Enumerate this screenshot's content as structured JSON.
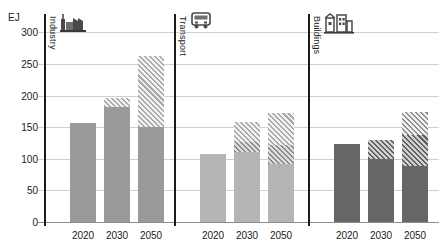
{
  "chart_data": {
    "type": "bar",
    "title": "",
    "ylabel": "EJ",
    "xlabel": "",
    "ylim": [
      0,
      310
    ],
    "yticks": [
      0,
      50,
      100,
      150,
      200,
      250,
      300
    ],
    "grid": true,
    "legend_position": "none",
    "categories": [
      "2020",
      "2030",
      "2050"
    ],
    "panels": [
      {
        "name": "Industry",
        "icon": "factory-icon",
        "base_color": "#9a9a9a",
        "series": [
          {
            "name": "solid",
            "style": "solid",
            "values": [
              156,
              182,
              150
            ]
          },
          {
            "name": "hatch",
            "style": "hatch-light",
            "values": [
              0,
              14,
              112
            ]
          }
        ],
        "totals": [
          156,
          196,
          262
        ]
      },
      {
        "name": "Transport",
        "icon": "bus-icon",
        "base_color": "#b5b5b5",
        "series": [
          {
            "name": "solid",
            "style": "solid",
            "values": [
              108,
              110,
              92
            ]
          },
          {
            "name": "hatch-dark",
            "style": "hatch-dark",
            "values": [
              0,
              16,
              30
            ]
          },
          {
            "name": "hatch-light",
            "style": "hatch-light",
            "values": [
              0,
              32,
              50
            ]
          }
        ],
        "totals": [
          108,
          158,
          172
        ]
      },
      {
        "name": "Buildings",
        "icon": "buildings-icon",
        "base_color": "#666666",
        "series": [
          {
            "name": "solid",
            "style": "solid",
            "values": [
              124,
              100,
              88
            ]
          },
          {
            "name": "hatch-dark",
            "style": "hatch-dark",
            "values": [
              0,
              30,
              50
            ]
          },
          {
            "name": "hatch-light",
            "style": "hatch-light",
            "values": [
              0,
              0,
              36
            ]
          }
        ],
        "totals": [
          124,
          130,
          174
        ]
      }
    ]
  }
}
